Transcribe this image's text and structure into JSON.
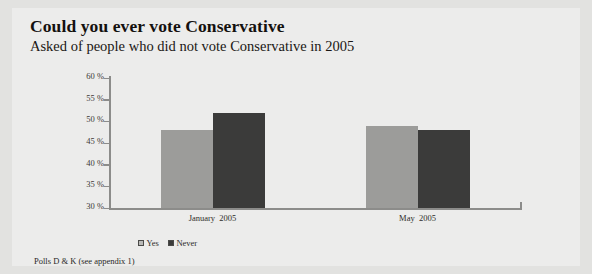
{
  "figure": {
    "title": "Could you ever vote Conservative",
    "subtitle": "Asked of people who did not vote Conservative in 2005",
    "footnote": "Polls D & K (see appendix 1)",
    "panel_bg": "#ececeb",
    "page_bg": "#e2e2e0"
  },
  "chart_data": {
    "type": "bar",
    "title": "Could you ever vote Conservative",
    "subtitle": "Asked of people who did not vote Conservative in 2005",
    "categories": [
      "January  2005",
      "May  2005"
    ],
    "series": [
      {
        "name": "Yes",
        "values": [
          48,
          49
        ],
        "color": "#9c9c9a"
      },
      {
        "name": "Never",
        "values": [
          52,
          48
        ],
        "color": "#3b3b3a"
      }
    ],
    "xlabel": "",
    "ylabel": "",
    "ylim": [
      30,
      60
    ],
    "ytick_values": [
      60,
      55,
      50,
      45,
      40,
      35,
      30
    ],
    "ytick_labels": [
      "60 %",
      "55 %",
      "50 %",
      "45 %",
      "40 %",
      "35 %",
      "30 %"
    ],
    "grid": false,
    "legend_position": "bottom-left",
    "note": "Polls D & K (see appendix 1)"
  }
}
